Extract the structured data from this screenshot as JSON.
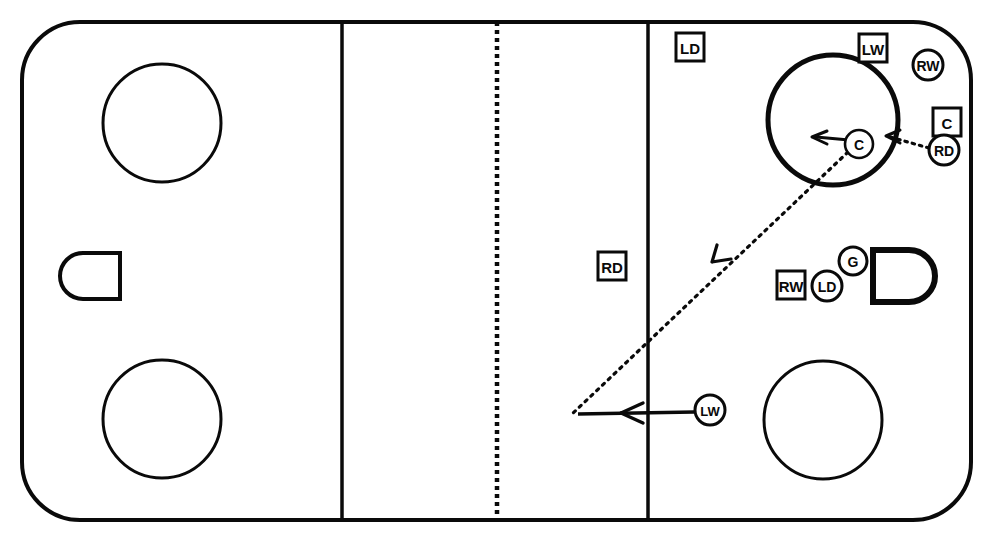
{
  "diagram": {
    "type": "ice-hockey-rink-play-diagram",
    "colors": {
      "ink": "#0a0a0a",
      "ice": "#ffffff"
    },
    "rink": {
      "board_corner_radius": 58,
      "left_blue_line_x": 342,
      "right_blue_line_x": 648,
      "center_line_x": 497,
      "center_line_style": "dotted"
    },
    "faceoff_circles": [
      {
        "id": "circle-top-left",
        "cx": 162,
        "cy": 123,
        "r": 59
      },
      {
        "id": "circle-bottom-left",
        "cx": 162,
        "cy": 419,
        "r": 59
      },
      {
        "id": "circle-top-right",
        "cx": 833,
        "cy": 120,
        "r": 65
      },
      {
        "id": "circle-bottom-right",
        "cx": 823,
        "cy": 420,
        "r": 59
      }
    ],
    "creases": [
      {
        "id": "crease-left",
        "side": "left",
        "x": 60,
        "y": 253,
        "w": 60,
        "h": 46
      },
      {
        "id": "crease-right",
        "side": "right",
        "x": 873,
        "y": 250,
        "w": 62,
        "h": 52
      }
    ],
    "markers": [
      {
        "id": "marker-ld-top-left-zone",
        "label": "LD",
        "shape": "square",
        "x": 690,
        "y": 47
      },
      {
        "id": "marker-lw-top",
        "label": "LW",
        "shape": "square",
        "x": 873,
        "y": 48
      },
      {
        "id": "marker-rw-top-corner",
        "label": "RW",
        "shape": "circle",
        "x": 928,
        "y": 65
      },
      {
        "id": "marker-c-right-edge",
        "label": "C",
        "shape": "square",
        "x": 947,
        "y": 122
      },
      {
        "id": "marker-rd-right-edge",
        "label": "RD",
        "shape": "circle",
        "x": 944,
        "y": 150
      },
      {
        "id": "marker-c-in-circle",
        "label": "C",
        "shape": "circle",
        "x": 859,
        "y": 144
      },
      {
        "id": "marker-rd-neutral-zone",
        "label": "RD",
        "shape": "square",
        "x": 612,
        "y": 266
      },
      {
        "id": "marker-rw-low-slot",
        "label": "RW",
        "shape": "square",
        "x": 791,
        "y": 285
      },
      {
        "id": "marker-ld-low-slot",
        "label": "LD",
        "shape": "circle",
        "x": 827,
        "y": 286
      },
      {
        "id": "marker-g-crease",
        "label": "G",
        "shape": "circle",
        "x": 853,
        "y": 261
      },
      {
        "id": "marker-lw-bottom",
        "label": "LW",
        "shape": "circle",
        "x": 710,
        "y": 410
      }
    ],
    "movement": {
      "skating_paths": [
        {
          "id": "path-lw-skate",
          "player": "LW",
          "style": "solid",
          "from_x": 694,
          "from_y": 412,
          "to_x": 572,
          "to_y": 414
        },
        {
          "id": "path-c-skate",
          "player": "C",
          "style": "solid",
          "from_x": 849,
          "from_y": 142,
          "to_x": 812,
          "to_y": 138
        }
      ],
      "pass_paths": [
        {
          "id": "pass-rd-to-c",
          "style": "dotted",
          "from_x": 929,
          "from_y": 148,
          "to_x": 886,
          "to_y": 137
        },
        {
          "id": "pass-c-to-lw",
          "style": "dotted",
          "from_x": 848,
          "from_y": 150,
          "to_x": 572,
          "to_y": 413
        }
      ]
    }
  }
}
